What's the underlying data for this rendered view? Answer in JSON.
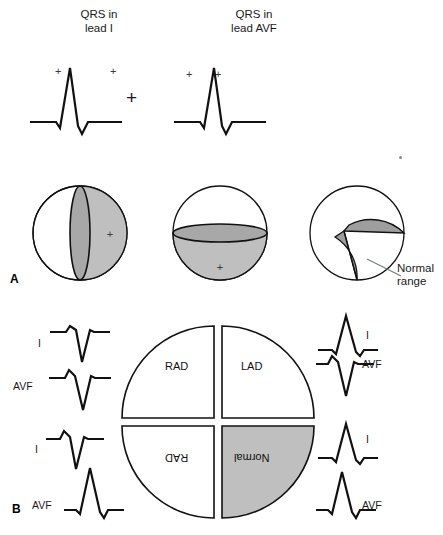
{
  "figure": {
    "panel_a_letter": "A",
    "panel_b_letter": "B"
  },
  "panel_a": {
    "captions": [
      {
        "text": "QRS in\nlead I"
      },
      {
        "text": "QRS in\nlead AVF"
      }
    ],
    "operator": "+",
    "polarity_marks": [
      "+",
      "+",
      "+",
      "+"
    ],
    "spheres": [
      {
        "name": "lead-I-positive-hemisphere",
        "shaded_half": "right",
        "plus_mark": "+",
        "plane": "vertical"
      },
      {
        "name": "lead-avf-positive-hemisphere",
        "shaded_half": "bottom",
        "plus_mark": "+",
        "plane": "horizontal"
      },
      {
        "name": "intersection-normal-range",
        "shaded_half": "wedge",
        "plus_mark": "",
        "plane": "wedge"
      }
    ],
    "annotation": "Normal\nrange"
  },
  "panel_b": {
    "quadrants": [
      {
        "id": "upper-left",
        "label": "RAD",
        "shaded": false,
        "flipped": false
      },
      {
        "id": "upper-right",
        "label": "LAD",
        "shaded": false,
        "flipped": false
      },
      {
        "id": "lower-left",
        "label": "RAD",
        "shaded": false,
        "flipped": true
      },
      {
        "id": "lower-right",
        "label": "Normal",
        "shaded": true,
        "flipped": true
      }
    ],
    "left_traces": [
      {
        "label": "I",
        "polarity": "negative"
      },
      {
        "label": "AVF",
        "polarity": "negative"
      },
      {
        "label": "I",
        "polarity": "negative"
      },
      {
        "label": "AVF",
        "polarity": "positive"
      }
    ],
    "right_traces": [
      {
        "label": "I",
        "polarity": "positive"
      },
      {
        "label": "AVF",
        "polarity": "negative"
      },
      {
        "label": "I",
        "polarity": "positive"
      },
      {
        "label": "AVF",
        "polarity": "positive"
      }
    ]
  },
  "colors": {
    "shade_gray": "#bfbfbf",
    "shade_gray_dark": "#a8a8a8",
    "stroke": "#111111",
    "leader_line": "#6f7b85"
  }
}
